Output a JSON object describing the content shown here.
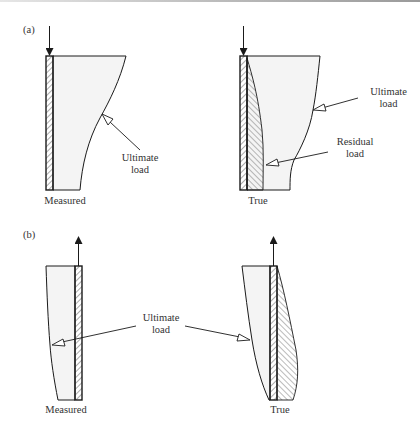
{
  "figure": {
    "panels": [
      {
        "tag": "(a)",
        "load_direction": "compression (downward arrow)",
        "diagrams": [
          {
            "caption": "Measured",
            "annotations": [
              {
                "label_line1": "Ultimate",
                "label_line2": "load"
              }
            ]
          },
          {
            "caption": "True",
            "annotations": [
              {
                "label_line1": "Ultimate",
                "label_line2": "load"
              },
              {
                "label_line1": "Residual",
                "label_line2": "load"
              }
            ]
          }
        ]
      },
      {
        "tag": "(b)",
        "load_direction": "tension (upward arrow)",
        "diagrams": [
          {
            "caption": "Measured"
          },
          {
            "caption": "True"
          }
        ],
        "shared_annotation": {
          "label_line1": "Ultimate",
          "label_line2": "load"
        }
      }
    ]
  },
  "colors": {
    "line": "#1a1a1a",
    "fill": "#f4f4f4",
    "text": "#333333",
    "hatch": "#444444"
  }
}
